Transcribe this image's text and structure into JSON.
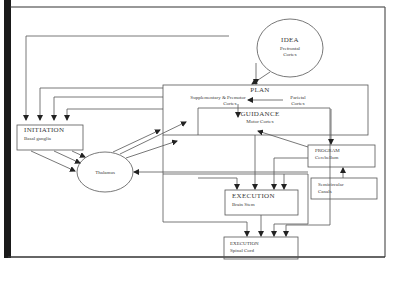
{
  "diagram": {
    "type": "flowchart",
    "nodes": [
      {
        "id": "idea",
        "title": "IDEA",
        "subtitle_lines": [
          "Prefrontal",
          "Cortex"
        ],
        "shape": "ellipse"
      },
      {
        "id": "plan",
        "title": "PLAN",
        "subtitle_lines": [
          "Supplementary & Premotor",
          "Cortex"
        ],
        "subtitle2_lines": [
          "Parietal",
          "Cortex"
        ],
        "shape": "rect"
      },
      {
        "id": "guidance",
        "title": "GUIDANCE",
        "subtitle_lines": [
          "Motor Cortex"
        ],
        "shape": "rect"
      },
      {
        "id": "initiation",
        "title": "INITIATION",
        "subtitle_lines": [
          "Basal ganglia"
        ],
        "shape": "rect"
      },
      {
        "id": "thalamus",
        "title": "Thalamus",
        "shape": "ellipse"
      },
      {
        "id": "program",
        "title": "PROGRAM",
        "subtitle_lines": [
          "Cerebellum"
        ],
        "shape": "rect"
      },
      {
        "id": "canals",
        "title": "Semicircular",
        "subtitle_lines": [
          "Canals"
        ],
        "shape": "rect"
      },
      {
        "id": "brainstem",
        "title": "EXECUTION",
        "subtitle_lines": [
          "Brain Stem"
        ],
        "shape": "rect"
      },
      {
        "id": "spinalcord",
        "title": "EXECUTION",
        "subtitle_lines": [
          "Spinal Cord"
        ],
        "shape": "rect"
      }
    ],
    "edges": [
      {
        "from": "idea",
        "to": "plan"
      },
      {
        "from": "idea",
        "to": "initiation"
      },
      {
        "from": "plan",
        "to": "initiation"
      },
      {
        "from": "guidance",
        "to": "initiation"
      },
      {
        "from": "initiation",
        "to": "thalamus"
      },
      {
        "from": "thalamus",
        "to": "plan"
      },
      {
        "from": "thalamus",
        "to": "guidance"
      },
      {
        "from": "plan",
        "to": "guidance"
      },
      {
        "from": "parietal",
        "to": "premotor"
      },
      {
        "from": "plan",
        "to": "program"
      },
      {
        "from": "program",
        "to": "guidance"
      },
      {
        "from": "program",
        "to": "thalamus"
      },
      {
        "from": "canals",
        "to": "program"
      },
      {
        "from": "guidance",
        "to": "brainstem"
      },
      {
        "from": "plan",
        "to": "brainstem"
      },
      {
        "from": "program",
        "to": "brainstem"
      },
      {
        "from": "brainstem",
        "to": "spinalcord"
      },
      {
        "from": "guidance",
        "to": "spinalcord"
      },
      {
        "from": "plan",
        "to": "spinalcord"
      }
    ]
  },
  "labels": {
    "idea_title": "IDEA",
    "idea_sub1": "Prefrontal",
    "idea_sub2": "Cortex",
    "plan_title": "PLAN",
    "plan_sub_left1": "Supplementary & Premotor",
    "plan_sub_left2": "Cortex",
    "plan_sub_right1": "Parietal",
    "plan_sub_right2": "Cortex",
    "guidance_title": "GUIDANCE",
    "guidance_sub": "Motor Cortex",
    "initiation_title": "INITIATION",
    "initiation_sub": "Basal ganglia",
    "thalamus": "Thalamus",
    "program_title": "PROGRAM",
    "program_sub": "Cerebellum",
    "canals_title": "Semicircular",
    "canals_sub": "Canals",
    "brainstem_title": "EXECUTION",
    "brainstem_sub": "Brain Stem",
    "spinal_title": "EXECUTION",
    "spinal_sub": "Spinal Cord"
  },
  "colors": {
    "stroke": "#555555",
    "frame": "#222222",
    "background": "#ffffff"
  }
}
